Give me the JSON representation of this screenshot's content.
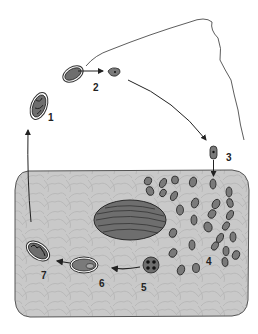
{
  "diagram": {
    "type": "life-cycle",
    "colors": {
      "background": "#ffffff",
      "host_cell_fill": "#c9c9c9",
      "host_cell_stroke": "#555555",
      "organism_fill": "#7a7a7a",
      "organism_stroke": "#2a2a2a",
      "nucleus_fill": "#6e6e6e",
      "arrow": "#222222"
    },
    "stages": [
      {
        "id": 1,
        "label": "1",
        "description": "oocyst"
      },
      {
        "id": 2,
        "label": "2",
        "description": "sporocyst releasing sporozoite"
      },
      {
        "id": 3,
        "label": "3",
        "description": "sporozoite entering host cell"
      },
      {
        "id": 4,
        "label": "4",
        "description": "multiplying stages in host cell"
      },
      {
        "id": 5,
        "label": "5",
        "description": "four-nucleated stage"
      },
      {
        "id": 6,
        "label": "6",
        "description": "encysting stage"
      },
      {
        "id": 7,
        "label": "7",
        "description": "mature oocyst"
      }
    ],
    "elements": {
      "host_cell": "host cell with cytoplasm texture",
      "host_nucleus": "striated nucleus",
      "flagellum_line": "wavy filament"
    }
  }
}
